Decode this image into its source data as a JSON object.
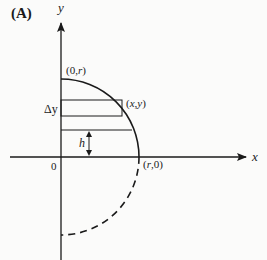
{
  "figure": {
    "panel_label": "(A)",
    "axes": {
      "x_label": "x",
      "y_label": "y",
      "origin_label": "0"
    },
    "points": {
      "top": "(0,r)",
      "right": "(r,0)",
      "curve_point": "(x,y)"
    },
    "annotations": {
      "strip_height": "Δy",
      "height": "h"
    },
    "shapes": {
      "upper_arc": "solid quarter circle from (0,r) to (r,0)",
      "lower_arc": "dashed quarter circle from (r,0) to (0,-r)",
      "strip": "horizontal rectangle of height Δy touching curve at (x,y)",
      "level_line": "horizontal line at height h above x-axis"
    },
    "colors": {
      "ink": "#1a1a1a",
      "background": "#fbfbfa"
    }
  }
}
